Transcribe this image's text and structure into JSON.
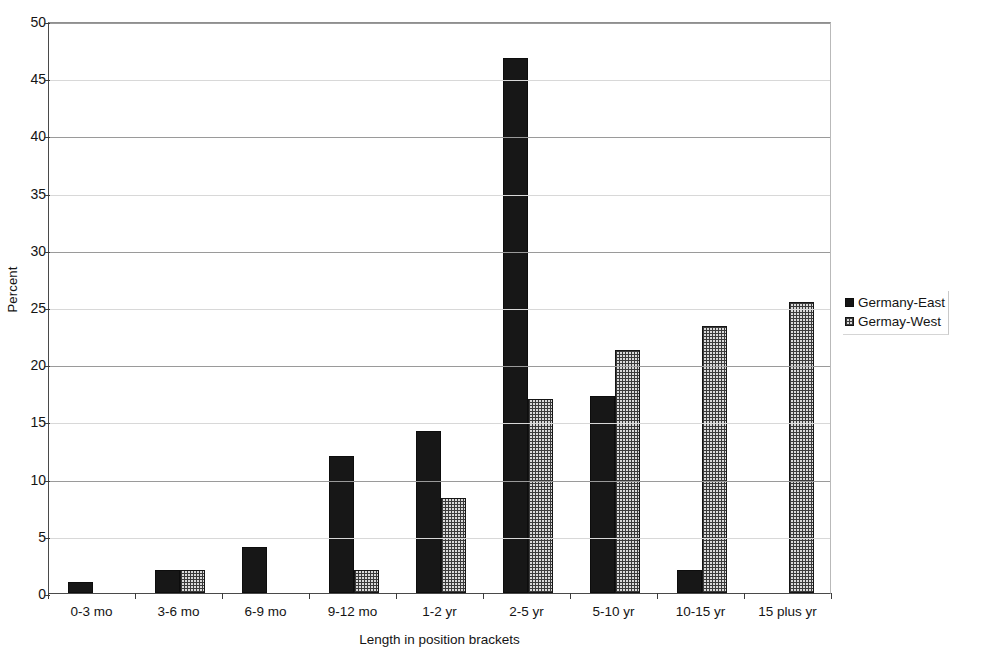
{
  "chart_data": {
    "type": "bar",
    "title": "",
    "xlabel": "Length in position brackets",
    "ylabel": "Percent",
    "ylim": [
      0,
      50
    ],
    "ytick_step": 5,
    "yticks": [
      0,
      5,
      10,
      15,
      20,
      25,
      30,
      35,
      40,
      45,
      50
    ],
    "grid": true,
    "grid_axis": "y",
    "legend_position": "right",
    "categories": [
      "0-3 mo",
      "3-6 mo",
      "6-9 mo",
      "9-12 mo",
      "1-2 yr",
      "2-5 yr",
      "5-10 yr",
      "10-15 yr",
      "15 plus yr"
    ],
    "series": [
      {
        "name": "Germany-East",
        "color": "#171717",
        "pattern": "solid",
        "values": [
          1.0,
          2.0,
          4.0,
          12.0,
          14.2,
          46.8,
          17.2,
          2.0,
          0
        ]
      },
      {
        "name": "Germay-West",
        "color": "#d9d9d9",
        "pattern": "dotted-grid",
        "values": [
          0,
          2.0,
          0,
          2.0,
          8.3,
          17.0,
          21.2,
          23.3,
          25.4
        ]
      }
    ]
  },
  "legend": {
    "items": [
      {
        "label": "Germany-East",
        "swatch": "solid-black-swatch"
      },
      {
        "label": "Germay-West",
        "swatch": "dotted-grid-swatch"
      }
    ]
  },
  "axes": {
    "y_title": "Percent",
    "x_title": "Length in position brackets"
  }
}
